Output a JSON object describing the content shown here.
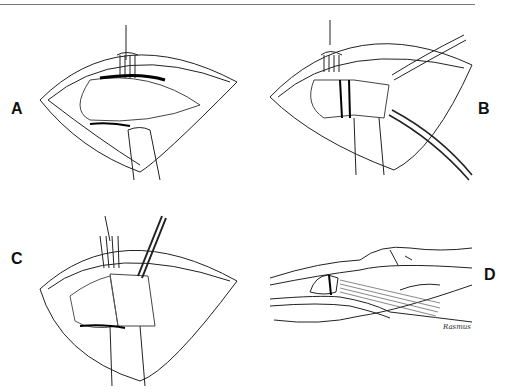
{
  "figure": {
    "panels": [
      {
        "id": "A",
        "label": "A",
        "description": "Open incision, retractor fork at top, forceps/retractor below, muscle fibers exposed"
      },
      {
        "id": "B",
        "label": "B",
        "description": "Tissue divided with clamp, tube/drain crossing to lower right"
      },
      {
        "id": "C",
        "label": "C",
        "description": "Retractor fork and catheter inserted, tissue folded over retractor"
      },
      {
        "id": "D",
        "label": "D",
        "description": "Longitudinal view of limb showing tendon/muscle transfer"
      }
    ],
    "signature": "Rasmus"
  }
}
